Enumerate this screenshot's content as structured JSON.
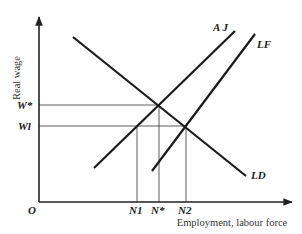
{
  "figure": {
    "caption_fragment": "Figure ... labour market ... equilibrium",
    "y_axis_label": "Real wage",
    "x_axis_label": "Employment, labour force",
    "origin_label": "O",
    "curves": [
      {
        "name": "AJ",
        "label": "A J",
        "x1": 94,
        "y1": 168,
        "x2": 235,
        "y2": 31
      },
      {
        "name": "LF",
        "label": "LF",
        "x1": 152,
        "y1": 171,
        "x2": 255,
        "y2": 34
      },
      {
        "name": "LD",
        "label": "LD",
        "x1": 73,
        "y1": 37,
        "x2": 246,
        "y2": 176
      }
    ],
    "wage_levels": [
      {
        "label": "W*",
        "y": 105,
        "x_end": 159
      },
      {
        "label": "Wl",
        "y": 126,
        "x_end": 186
      }
    ],
    "employment_levels": [
      {
        "label": "N1",
        "x": 137,
        "y_top": 126
      },
      {
        "label": "N*",
        "x": 159,
        "y_top": 105
      },
      {
        "label": "N2",
        "x": 186,
        "y_top": 126
      }
    ]
  },
  "labels": {
    "aj": "A J",
    "lf": "LF",
    "ld": "LD",
    "w_star": "W*",
    "w_1": "Wl",
    "n_1": "N1",
    "n_star": "N*",
    "n_2": "N2",
    "origin": "O",
    "y_axis": "Real wage",
    "x_axis": "Employment, labour force"
  }
}
